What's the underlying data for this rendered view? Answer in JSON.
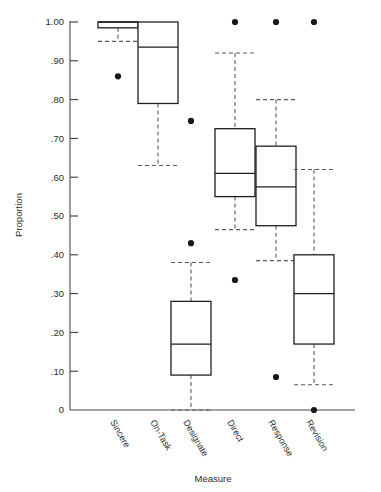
{
  "chart_data": {
    "type": "box",
    "title": "",
    "xlabel": "Measure",
    "ylabel": "Proportion",
    "ylim": [
      0,
      1.0
    ],
    "grid": false,
    "legend": null,
    "ytick_labels": [
      "1.00",
      ".90",
      ".80",
      ".70",
      ".60",
      ".50",
      ".40",
      ".30",
      ".20",
      ".10",
      "0"
    ],
    "ytick_values": [
      1.0,
      0.9,
      0.8,
      0.7,
      0.6,
      0.5,
      0.4,
      0.3,
      0.2,
      0.1,
      0.0
    ],
    "categories": [
      "Sincere",
      "On-Task",
      "Designate",
      "Direct",
      "Response",
      "Revision"
    ],
    "boxes": [
      {
        "category": "Sincere",
        "whisker_low": 0.95,
        "q1": 0.985,
        "median": 1.0,
        "q3": 1.0,
        "whisker_high": 1.0,
        "outliers": [
          0.86
        ]
      },
      {
        "category": "On-Task",
        "whisker_low": 0.63,
        "q1": 0.79,
        "median": 0.935,
        "q3": 1.0,
        "whisker_high": 1.0,
        "outliers": []
      },
      {
        "category": "Designate",
        "whisker_low": 0.0,
        "q1": 0.09,
        "median": 0.17,
        "q3": 0.28,
        "whisker_high": 0.38,
        "outliers": [
          0.745,
          0.43
        ]
      },
      {
        "category": "Direct",
        "whisker_low": 0.465,
        "q1": 0.55,
        "median": 0.61,
        "q3": 0.725,
        "whisker_high": 0.92,
        "outliers": [
          1.0,
          0.335
        ]
      },
      {
        "category": "Response",
        "whisker_low": 0.385,
        "q1": 0.475,
        "median": 0.575,
        "q3": 0.68,
        "whisker_high": 0.8,
        "outliers": [
          1.0,
          0.085
        ]
      },
      {
        "category": "Revision",
        "whisker_low": 0.065,
        "q1": 0.17,
        "median": 0.3,
        "q3": 0.4,
        "whisker_high": 0.62,
        "outliers": [
          1.0,
          0.0
        ]
      }
    ]
  },
  "axes": {
    "y_title": "Proportion",
    "x_title": "Measure"
  }
}
